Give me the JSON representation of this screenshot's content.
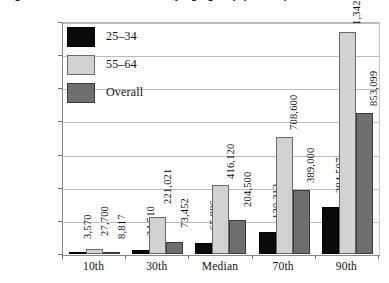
{
  "title": "Figure: Net worth distribution by age group (dollars)",
  "chart_data": {
    "type": "bar",
    "title": "Figure: Net worth distribution by age group (dollars)",
    "xlabel": "",
    "ylabel": "",
    "categories": [
      "10th",
      "30th",
      "Median",
      "70th",
      "90th"
    ],
    "series": [
      {
        "name": "25–34",
        "color": "#0b0b0b",
        "values": [
          3570,
          24510,
          65886,
          130213,
          284507
        ],
        "labels": [
          "3,570",
          "24,510",
          "65,886",
          "130,213",
          "284,507"
        ]
      },
      {
        "name": "55–64",
        "color": "#d2d2d2",
        "values": [
          27700,
          221021,
          416120,
          708600,
          1342003
        ],
        "labels": [
          "27,700",
          "221,021",
          "416,120",
          "708,600",
          "1,342,003"
        ]
      },
      {
        "name": "Overall",
        "color": "#6f6f6f",
        "values": [
          8817,
          73452,
          204500,
          389000,
          853099
        ],
        "labels": [
          "8,817",
          "73,452",
          "204,500",
          "389,000",
          "853,099"
        ]
      }
    ],
    "ylim": [
      0,
      1400000
    ],
    "yticks": [
      0,
      200000,
      400000,
      600000,
      800000,
      1000000,
      1200000,
      1400000
    ],
    "ytick_labels": [
      "0",
      "200,000",
      "400,000",
      "600,000",
      "800,000",
      "1,000,000",
      "1,200,000",
      "1,400,000"
    ],
    "grid": true,
    "legend_position": "top-left",
    "legend": [
      "25–34",
      "55–64",
      "Overall"
    ]
  }
}
